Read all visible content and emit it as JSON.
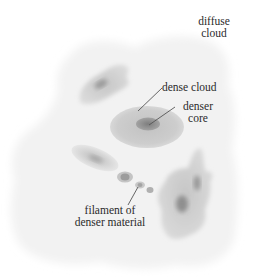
{
  "diagram": {
    "title": "",
    "labels": {
      "diffuse_cloud": [
        "diffuse",
        "cloud"
      ],
      "dense_cloud": "dense cloud",
      "denser_core": [
        "denser",
        "core"
      ],
      "filament": [
        "filament of",
        "denser material"
      ]
    },
    "colors": {
      "background": "#ffffff",
      "diffuse": "#f1f1f1",
      "dense": "#c9c9c9",
      "core": "#8f8f8f",
      "text": "#2b2b2b",
      "leader_line": "#555555"
    },
    "elements": [
      {
        "name": "diffuse-cloud",
        "shape": "irregular",
        "region": [
          10,
          30,
          240,
          270
        ]
      },
      {
        "name": "dense-cloud-upper-left",
        "shape": "irregular blob",
        "center": [
          104,
          84
        ]
      },
      {
        "name": "dense-cloud-center",
        "shape": "ellipse",
        "center": [
          147,
          125
        ],
        "core": [
          148,
          124
        ]
      },
      {
        "name": "filament",
        "shape": "chain of ellipses",
        "points": [
          [
            95,
            158
          ],
          [
            124,
            177
          ],
          [
            140,
            185
          ],
          [
            150,
            190
          ]
        ]
      },
      {
        "name": "dense-cloud-lower-right",
        "shape": "irregular blob",
        "center": [
          185,
          200
        ],
        "cores": [
          [
            182,
            203
          ],
          [
            197,
            182
          ]
        ]
      }
    ]
  }
}
